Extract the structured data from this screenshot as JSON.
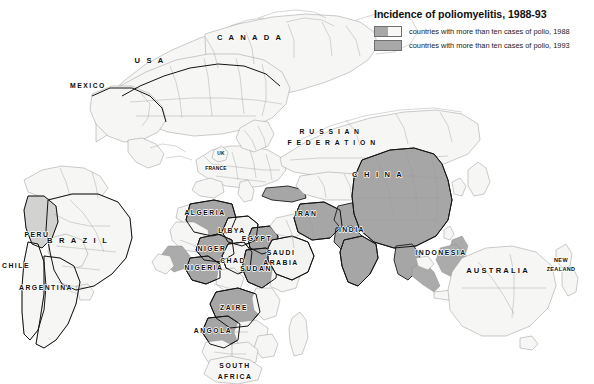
{
  "legend": {
    "title": "Incidence of poliomyelitis, 1988-93",
    "items": [
      {
        "label": "countries with more than ten cases of polio, 1988",
        "swatch": "split",
        "color_left": "#a8a8a8",
        "color_right": "#f7f7f5"
      },
      {
        "label": "countries with more than ten cases of polio, 1993",
        "swatch": "solid",
        "color_left": "#a8a8a8",
        "color_right": "#a8a8a8"
      }
    ]
  },
  "palette": {
    "background": "#ffffff",
    "land_unaffected": "#f6f6f4",
    "land_affected": "#ababab",
    "border_light": "#8d8d8d",
    "border_heavy": "#141414",
    "label_text": "#0d0d0d"
  },
  "map": {
    "projection_note": "world map, Pacific-centred oblique",
    "labels": [
      {
        "name": "USA",
        "text": "U S A",
        "x": 150,
        "y": 63,
        "size": "big"
      },
      {
        "name": "CANADA",
        "text": "C A N A D A",
        "x": 250,
        "y": 40,
        "size": "big"
      },
      {
        "name": "MEXICO",
        "text": "MEXICO",
        "x": 88,
        "y": 88,
        "size": "med"
      },
      {
        "name": "BRAZIL",
        "text": "B R A Z I L",
        "x": 78,
        "y": 243,
        "size": "big"
      },
      {
        "name": "PERU",
        "text": "PERU",
        "x": 37,
        "y": 237,
        "size": "med"
      },
      {
        "name": "CHILE",
        "text": "CHILE",
        "x": 14,
        "y": 268,
        "size": "med"
      },
      {
        "name": "ARGENTINA",
        "text": "ARGENTINA",
        "x": 46,
        "y": 290,
        "size": "med"
      },
      {
        "name": "UK",
        "text": "UK",
        "x": 221,
        "y": 155,
        "size": "tiny"
      },
      {
        "name": "FRANCE",
        "text": "FRANCE",
        "x": 216,
        "y": 170,
        "size": "tiny"
      },
      {
        "name": "RUSSIAN-FEDERATION",
        "text": "R U S S I A N",
        "x": 330,
        "y": 134,
        "size": "med"
      },
      {
        "name": "RUSSIAN-FEDERATION2",
        "text": "F E D E R A T I O N",
        "x": 332,
        "y": 145,
        "size": "med"
      },
      {
        "name": "CHINA",
        "text": "C H I N A",
        "x": 378,
        "y": 177,
        "size": "big"
      },
      {
        "name": "INDIA",
        "text": "INDIA",
        "x": 352,
        "y": 232,
        "size": "med"
      },
      {
        "name": "IRAN",
        "text": "IRAN",
        "x": 306,
        "y": 216,
        "size": "med"
      },
      {
        "name": "SAUDI-ARABIA",
        "text": "SAUDI",
        "x": 281,
        "y": 255,
        "size": "med"
      },
      {
        "name": "SAUDI-ARABIA2",
        "text": "ARABIA",
        "x": 281,
        "y": 265,
        "size": "med"
      },
      {
        "name": "ALGERIA",
        "text": "ALGERIA",
        "x": 205,
        "y": 215,
        "size": "med"
      },
      {
        "name": "LIBYA",
        "text": "LIBYA",
        "x": 232,
        "y": 233,
        "size": "med"
      },
      {
        "name": "EGYPT",
        "text": "EGYPT",
        "x": 257,
        "y": 241,
        "size": "med"
      },
      {
        "name": "NIGER",
        "text": "NIGER",
        "x": 212,
        "y": 251,
        "size": "med"
      },
      {
        "name": "NIGERIA",
        "text": "NIGERIA",
        "x": 204,
        "y": 270,
        "size": "med"
      },
      {
        "name": "CHAD",
        "text": "CHAD",
        "x": 233,
        "y": 263,
        "size": "med"
      },
      {
        "name": "SUDAN",
        "text": "SUDAN",
        "x": 256,
        "y": 271,
        "size": "med"
      },
      {
        "name": "ZAIRE",
        "text": "ZAIRE",
        "x": 234,
        "y": 310,
        "size": "med"
      },
      {
        "name": "ANGOLA",
        "text": "ANGOLA",
        "x": 213,
        "y": 333,
        "size": "med"
      },
      {
        "name": "SOUTH-AFRICA",
        "text": "SOUTH",
        "x": 235,
        "y": 368,
        "size": "med"
      },
      {
        "name": "SOUTH-AFRICA2",
        "text": "AFRICA",
        "x": 235,
        "y": 379,
        "size": "med"
      },
      {
        "name": "INDONESIA",
        "text": "INDONESIA",
        "x": 441,
        "y": 255,
        "size": "med"
      },
      {
        "name": "AUSTRALIA",
        "text": "AUSTRALIA",
        "x": 498,
        "y": 273,
        "size": "big"
      },
      {
        "name": "NEW-ZEALAND",
        "text": "NEW",
        "x": 561,
        "y": 262,
        "size": "sm"
      },
      {
        "name": "NEW-ZEALAND2",
        "text": "ZEALAND",
        "x": 561,
        "y": 271,
        "size": "sm"
      }
    ]
  }
}
